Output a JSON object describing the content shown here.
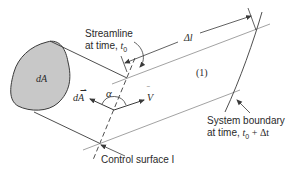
{
  "diagram": {
    "area_label": "dA",
    "streamline_label_line1": "Streamline",
    "streamline_label_line2": "at time, ",
    "streamline_time": "t",
    "streamline_time_sub": "0",
    "delta_l_label": "Δl",
    "region_label": "(1)",
    "angle_label": "α",
    "area_vector_label": "dA",
    "velocity_label": "V",
    "system_boundary_line1": "System boundary",
    "system_boundary_line2": "at time, ",
    "system_boundary_time": "t",
    "system_boundary_time_sub": "0",
    "system_boundary_time_suffix": " + Δt",
    "control_surface_label": "Control surface I",
    "colors": {
      "blob_fill": "#c8c8c8",
      "line": "#3a3a3a",
      "streamline": "#8a8a8a",
      "text": "#2a2a2a"
    }
  }
}
